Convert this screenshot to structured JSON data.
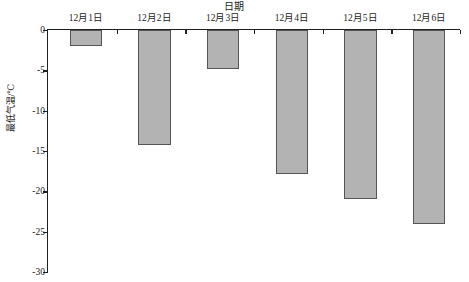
{
  "chart_data": {
    "type": "bar",
    "title": "日期",
    "xlabel": "日期",
    "ylabel": "最低气温/℃",
    "categories": [
      "12月1日",
      "12月2日",
      "12月3日",
      "12月4日",
      "12月5日",
      "12月6日"
    ],
    "values": [
      -2,
      -14.2,
      -4.8,
      -17.8,
      -21,
      -24
    ],
    "ylim": [
      -30,
      0
    ],
    "yticks": [
      0,
      -5,
      -10,
      -15,
      -20,
      -25,
      -30
    ],
    "ytick_labels": [
      "0",
      "-5",
      "-10",
      "-15",
      "-20",
      "-25",
      "-30"
    ],
    "grid": false,
    "legend": null,
    "bar_color": "#b3b3b3",
    "bar_border_color": "#555555",
    "axis_color": "#1f1f1f",
    "category_labels_position": "above-zero-line"
  }
}
